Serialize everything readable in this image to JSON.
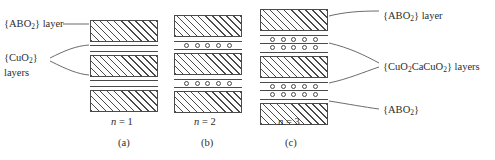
{
  "figure": {
    "background_color": "#ffffff",
    "line_color": "#4a4a4a",
    "text_color": "#2d2d2d"
  },
  "labels": {
    "left_abo": {
      "text": "{ABO2} layer",
      "prefix": "{ABO",
      "sub": "2",
      "suffix": "} layer"
    },
    "left_cuo_line1": {
      "prefix": "{CuO",
      "sub": "2",
      "suffix": "}"
    },
    "left_cuo_line2": "layers",
    "right_abo_layer": {
      "prefix": "{ABO",
      "sub": "2",
      "suffix": "} layer"
    },
    "right_middle": {
      "p1": "{CuO",
      "s1": "2",
      "p2": "CaCuO",
      "s2": "2",
      "p3": "} layers"
    },
    "right_abo": {
      "prefix": "{ABO",
      "sub": "2",
      "suffix": "}"
    }
  },
  "panels": [
    {
      "id": "a",
      "n_label_prefix": "n",
      "n_label_suffix": " = 1",
      "n_value": 1,
      "caption": "(a)",
      "blocks": 3,
      "gap_type": "plain",
      "circle_rows_per_gap": 0,
      "circles_per_row": 0
    },
    {
      "id": "b",
      "n_label_prefix": "n",
      "n_label_suffix": " = 2",
      "n_value": 2,
      "caption": "(b)",
      "blocks": 3,
      "gap_type": "single",
      "circle_rows_per_gap": 1,
      "circles_per_row": 5
    },
    {
      "id": "c",
      "n_label_prefix": "n",
      "n_label_suffix": " = 3",
      "n_value": 3,
      "caption": "(c)",
      "blocks": 3,
      "gap_type": "double",
      "circle_rows_per_gap": 2,
      "circles_per_row": 5
    }
  ],
  "diagram_meta": {
    "type": "layered-structure-schematic",
    "description": "Schematic of cuprate superconductor layer stacking for n = 1, 2, 3",
    "hatch_angle_deg": 45,
    "leader_lines": 6
  }
}
